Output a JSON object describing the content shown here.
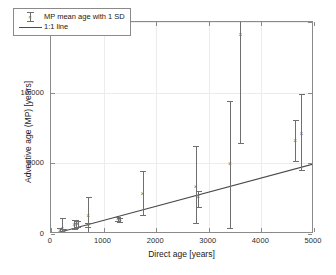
{
  "chart_data": {
    "type": "scatter",
    "title": "",
    "xlabel": "Direct age [years]",
    "ylabel": "Advective age (MP) [years]",
    "xlim": [
      0,
      5000
    ],
    "ylim": [
      0,
      15000
    ],
    "xticks": [
      0,
      1000,
      2000,
      3000,
      4000,
      5000
    ],
    "yticks": [
      0,
      5000,
      10000,
      15000
    ],
    "xticklabels": [
      "0",
      "1000",
      "2000",
      "3000",
      "4000",
      "5000"
    ],
    "yticklabels": [
      "0",
      "5000",
      "10 000",
      "15000"
    ],
    "grid": true,
    "legend_position": "upper left",
    "legend": [
      {
        "label": "MP mean age with 1 SD",
        "marker": "errorbar-x"
      },
      {
        "label": "1:1 line",
        "marker": "line"
      }
    ],
    "series": [
      {
        "name": "MP mean age with 1 SD",
        "marker": "x",
        "color": "#6f6f6f",
        "error_type": "1 SD",
        "points": [
          {
            "x": 170,
            "y": 230,
            "y_low": 60,
            "y_high": 420
          },
          {
            "x": 215,
            "y": 330,
            "y_low": 110,
            "y_high": 1150
          },
          {
            "x": 245,
            "y": 200,
            "y_low": 70,
            "y_high": 330
          },
          {
            "x": 440,
            "y": 640,
            "y_low": 330,
            "y_high": 1000
          },
          {
            "x": 470,
            "y": 700,
            "y_low": 420,
            "y_high": 980
          },
          {
            "x": 505,
            "y": 690,
            "y_low": 470,
            "y_high": 920
          },
          {
            "x": 700,
            "y": 640,
            "y_low": 480,
            "y_high": 800
          },
          {
            "x": 705,
            "y": 1300,
            "y_low": 170,
            "y_high": 2650
          },
          {
            "x": 1270,
            "y": 1050,
            "y_low": 900,
            "y_high": 1200
          },
          {
            "x": 1310,
            "y": 1020,
            "y_low": 880,
            "y_high": 1160
          },
          {
            "x": 1740,
            "y": 2800,
            "y_low": 1350,
            "y_high": 4450
          },
          {
            "x": 2750,
            "y": 3350,
            "y_low": 800,
            "y_high": 6200
          },
          {
            "x": 2800,
            "y": 2600,
            "y_low": 1900,
            "y_high": 3050
          },
          {
            "x": 3400,
            "y": 4950,
            "y_low": 450,
            "y_high": 9400
          },
          {
            "x": 3600,
            "y": 14100,
            "y_low": 6450,
            "y_high": 15000
          },
          {
            "x": 4640,
            "y": 6550,
            "y_low": 5150,
            "y_high": 8050
          },
          {
            "x": 4760,
            "y": 7100,
            "y_low": 4550,
            "y_high": 9900
          }
        ]
      },
      {
        "name": "1:1 line",
        "type": "line",
        "color": "#4a4a4a",
        "from": {
          "x": 0,
          "y": 0
        },
        "to": {
          "x": 5000,
          "y": 5000
        }
      }
    ]
  }
}
